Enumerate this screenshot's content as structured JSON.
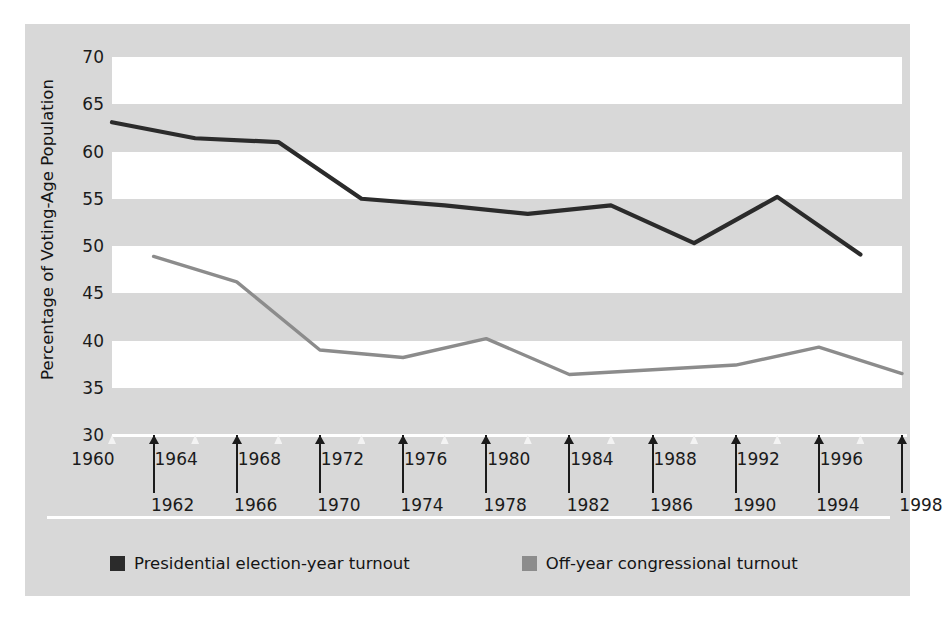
{
  "chart_data": {
    "type": "line",
    "title": "",
    "xlabel": "",
    "ylabel": "Percentage of Voting-Age Population",
    "ylim": [
      30,
      70
    ],
    "yticks": [
      70,
      65,
      60,
      55,
      50,
      45,
      40,
      35,
      30
    ],
    "ytick_labels": [
      "70",
      "65",
      "60",
      "55",
      "50",
      "45",
      "40",
      "35",
      "30"
    ],
    "xlim": [
      1960,
      1998
    ],
    "x_all": [
      1960,
      1962,
      1964,
      1966,
      1968,
      1970,
      1972,
      1974,
      1976,
      1978,
      1980,
      1982,
      1984,
      1986,
      1988,
      1990,
      1992,
      1994,
      1996,
      1998
    ],
    "x_top_row": [
      "1960",
      "1964",
      "1968",
      "1972",
      "1976",
      "1980",
      "1984",
      "1988",
      "1992",
      "1996"
    ],
    "x_bottom_row": [
      "1962",
      "1966",
      "1970",
      "1974",
      "1978",
      "1982",
      "1986",
      "1990",
      "1994",
      "1998"
    ],
    "grid": "horizontal-bands",
    "legend_position": "bottom-left",
    "series": [
      {
        "name": "Presidential election-year turnout",
        "color": "#2b2b2b",
        "x": [
          1960,
          1964,
          1968,
          1972,
          1976,
          1980,
          1984,
          1988,
          1992,
          1996
        ],
        "values": [
          63.1,
          61.4,
          61.0,
          55.0,
          54.3,
          53.4,
          54.3,
          50.3,
          55.2,
          49.1
        ]
      },
      {
        "name": "Off-year congressional turnout",
        "color": "#8c8c8c",
        "x": [
          1962,
          1966,
          1970,
          1974,
          1978,
          1982,
          1986,
          1990,
          1994,
          1998
        ],
        "values": [
          48.9,
          46.2,
          39.0,
          38.2,
          40.2,
          36.4,
          36.9,
          37.4,
          39.3,
          36.5
        ]
      }
    ]
  },
  "legend": {
    "items": [
      {
        "label": "Presidential election-year turnout",
        "color": "#2b2b2b"
      },
      {
        "label": "Off-year congressional turnout",
        "color": "#8c8c8c"
      }
    ]
  },
  "colors": {
    "figure_background": "#d8d8d8",
    "band_light": "#ffffff",
    "presidential_line": "#2b2b2b",
    "offyear_line": "#8c8c8c",
    "text": "#141414"
  }
}
